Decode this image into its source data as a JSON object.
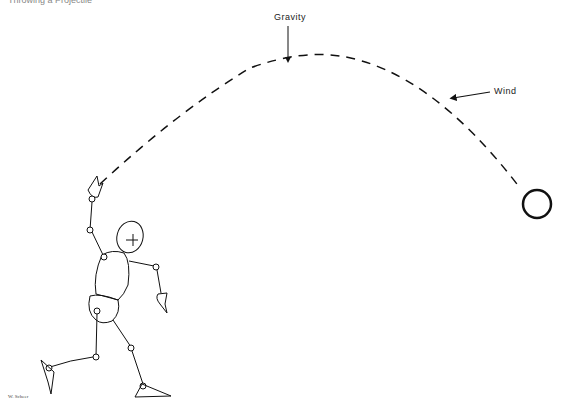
{
  "header": {
    "clipped_text": "Throwing a Projectile"
  },
  "labels": {
    "gravity": "Gravity",
    "wind": "Wind",
    "signature": "W. Scheer"
  },
  "colors": {
    "ink": "#111111",
    "background": "#ffffff"
  },
  "figure": {
    "trajectory": "dashed parabolic arc from hand to ball",
    "projectile": "ball",
    "thrower": "jointed stick figure mannequin"
  }
}
